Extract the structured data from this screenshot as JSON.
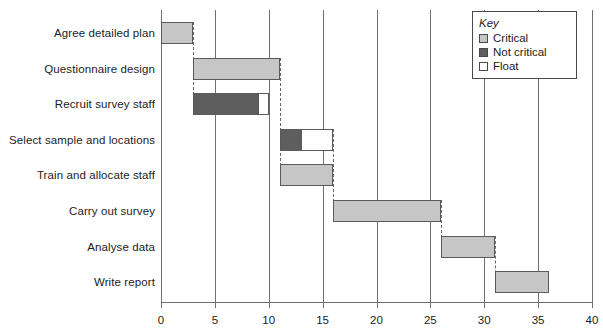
{
  "chart_data": {
    "type": "bar",
    "chart_kind": "gantt",
    "title": "",
    "xlabel": "",
    "ylabel": "",
    "xlim": [
      0,
      40
    ],
    "xticks": [
      0,
      5,
      10,
      15,
      20,
      25,
      30,
      35,
      40
    ],
    "xtick_labels": [
      "0",
      "5",
      "10",
      "15",
      "20",
      "25",
      "30",
      "35",
      "40"
    ],
    "grid": true,
    "grid_axis": "x",
    "legend_position": "top-right",
    "categories": [
      "Agree detailed plan",
      "Questionnaire design",
      "Recruit survey staff",
      "Select sample and locations",
      "Train and allocate staff",
      "Carry out survey",
      "Analyse data",
      "Write report"
    ],
    "tasks": [
      {
        "name": "Agree detailed plan",
        "start": 0,
        "end": 3,
        "duration": 3,
        "type": "critical",
        "float_start": null,
        "float_end": null,
        "float": 0
      },
      {
        "name": "Questionnaire design",
        "start": 3,
        "end": 11,
        "duration": 8,
        "type": "critical",
        "float_start": null,
        "float_end": null,
        "float": 0
      },
      {
        "name": "Recruit survey staff",
        "start": 3,
        "end": 9,
        "duration": 6,
        "type": "not critical",
        "float_start": 9,
        "float_end": 10,
        "float": 1
      },
      {
        "name": "Select sample and locations",
        "start": 11,
        "end": 13,
        "duration": 2,
        "type": "not critical",
        "float_start": 13,
        "float_end": 16,
        "float": 3
      },
      {
        "name": "Train and allocate staff",
        "start": 11,
        "end": 16,
        "duration": 5,
        "type": "critical",
        "float_start": null,
        "float_end": null,
        "float": 0
      },
      {
        "name": "Carry out survey",
        "start": 16,
        "end": 26,
        "duration": 10,
        "type": "critical",
        "float_start": null,
        "float_end": null,
        "float": 0
      },
      {
        "name": "Analyse data",
        "start": 26,
        "end": 31,
        "duration": 5,
        "type": "critical",
        "float_start": null,
        "float_end": null,
        "float": 0
      },
      {
        "name": "Write report",
        "start": 31,
        "end": 36,
        "duration": 5,
        "type": "critical",
        "float_start": null,
        "float_end": null,
        "float": 0
      }
    ],
    "dependency_links": [
      {
        "x": 3,
        "from_row": 0,
        "to_row": 2
      },
      {
        "x": 11,
        "from_row": 1,
        "to_row": 4
      },
      {
        "x": 10,
        "from_row": 2,
        "to_row": 3
      },
      {
        "x": 16,
        "from_row": 3,
        "to_row": 5
      },
      {
        "x": 16,
        "from_row": 4,
        "to_row": 5
      },
      {
        "x": 26,
        "from_row": 5,
        "to_row": 6
      },
      {
        "x": 31,
        "from_row": 6,
        "to_row": 7
      }
    ],
    "legend": {
      "title": "Key",
      "entries": [
        {
          "label": "Critical",
          "swatch": "critical",
          "color": "#c6c6c6"
        },
        {
          "label": "Not critical",
          "swatch": "notcritical",
          "color": "#5e5e5e"
        },
        {
          "label": "Float",
          "swatch": "float",
          "color": "#ffffff"
        }
      ]
    },
    "colors": {
      "critical": "#c6c6c6",
      "not_critical": "#5e5e5e",
      "float": "#ffffff",
      "axis": "#6f6f6f",
      "bar_outline": "#5a5a5a",
      "text": "#1c1c1c",
      "background": "#ffffff"
    }
  }
}
